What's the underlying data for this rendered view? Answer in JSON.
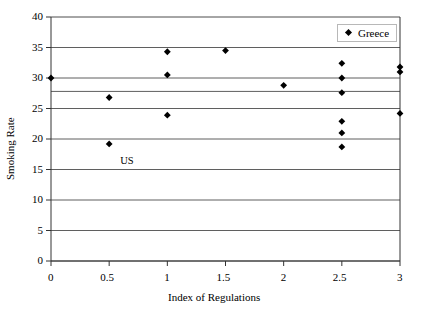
{
  "chart_data": {
    "type": "scatter",
    "title": "",
    "xlabel": "Index of Regulations",
    "ylabel": "Smoking Rate",
    "xlim": [
      0,
      3
    ],
    "ylim": [
      0,
      40
    ],
    "xticks": [
      "0",
      "0.5",
      "1",
      "1.5",
      "2",
      "2.5",
      "3"
    ],
    "xtick_values": [
      0,
      0.5,
      1,
      1.5,
      2,
      2.5,
      3
    ],
    "yticks": [
      "0",
      "5",
      "10",
      "15",
      "20",
      "25",
      "30",
      "35",
      "40"
    ],
    "ytick_values": [
      0,
      5,
      10,
      15,
      20,
      25,
      30,
      35,
      40
    ],
    "grid": "horizontal",
    "legend_position": "top-right-inside",
    "marker": "diamond",
    "marker_color": "#000000",
    "series": [
      {
        "name": "Greece",
        "points": [
          {
            "x": 0,
            "y": 30.0
          },
          {
            "x": 0.5,
            "y": 26.8
          },
          {
            "x": 0.5,
            "y": 19.2
          },
          {
            "x": 1,
            "y": 34.3
          },
          {
            "x": 1,
            "y": 30.5
          },
          {
            "x": 1,
            "y": 23.9
          },
          {
            "x": 1.5,
            "y": 34.5
          },
          {
            "x": 2,
            "y": 28.8
          },
          {
            "x": 2.5,
            "y": 32.4
          },
          {
            "x": 2.5,
            "y": 30.0
          },
          {
            "x": 2.5,
            "y": 27.6
          },
          {
            "x": 2.5,
            "y": 22.9
          },
          {
            "x": 2.5,
            "y": 21.0
          },
          {
            "x": 2.5,
            "y": 18.7
          },
          {
            "x": 3,
            "y": 31.8
          },
          {
            "x": 3,
            "y": 31.0
          },
          {
            "x": 3,
            "y": 24.2
          }
        ]
      }
    ],
    "annotations": [
      {
        "text": "US",
        "x": 0.5,
        "y": 16.3
      }
    ]
  },
  "legend": {
    "entries": [
      {
        "label": "Greece",
        "marker": "diamond",
        "color": "#000000"
      }
    ]
  },
  "axes": {
    "y_title": "Smoking Rate",
    "x_title": "Index of Regulations"
  }
}
